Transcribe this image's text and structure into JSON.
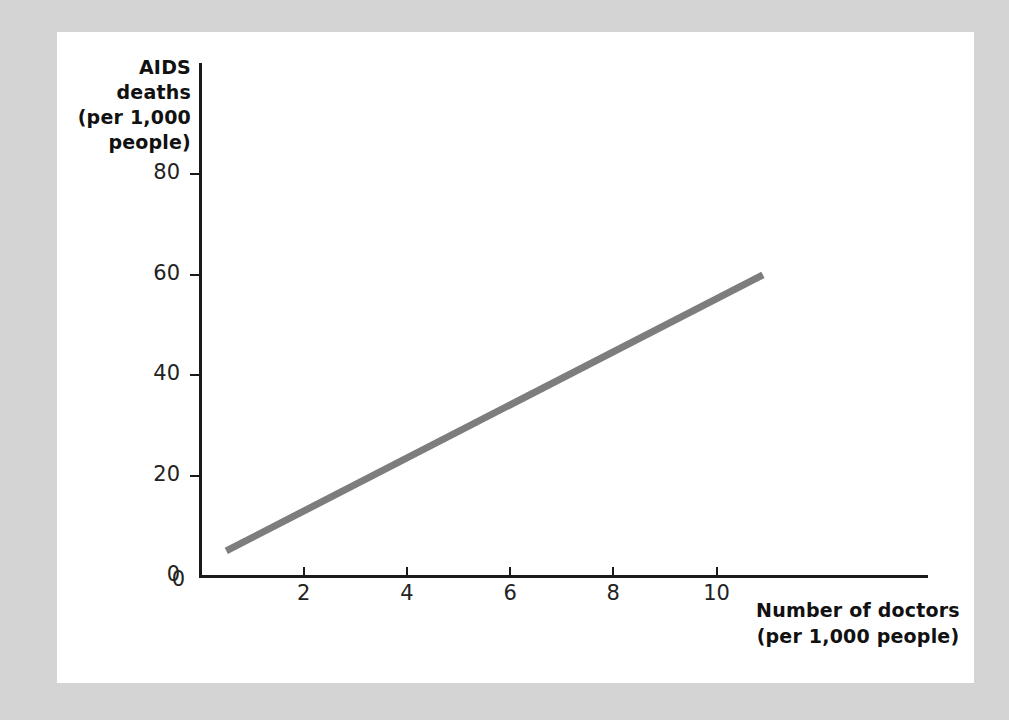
{
  "figure": {
    "background_color": "#d4d4d4",
    "page_color": "#ffffff"
  },
  "chart_data": {
    "type": "line",
    "title": "",
    "xlabel": "Number of doctors (per 1,000 people)",
    "ylabel": "AIDS deaths (per 1,000 people)",
    "xlabel_lines": [
      "Number of doctors",
      "(per 1,000 people)"
    ],
    "ylabel_lines": [
      "AIDS",
      "deaths",
      "(per 1,000",
      "people)"
    ],
    "xlim": [
      0,
      13.6
    ],
    "ylim": [
      0,
      89
    ],
    "xticks": [
      0,
      2,
      4,
      6,
      8,
      10
    ],
    "yticks": [
      0,
      20,
      40,
      60,
      80
    ],
    "xtick_labels": [
      "0",
      "2",
      "4",
      "6",
      "8",
      "10"
    ],
    "ytick_labels": [
      "0",
      "20",
      "40",
      "60",
      "80"
    ],
    "grid": false,
    "legend": false,
    "series": [
      {
        "name": "AIDS deaths vs doctors",
        "color": "#7d7d7d",
        "line_width": 7,
        "x": [
          0.5,
          10.9
        ],
        "y": [
          5,
          60
        ],
        "points": [
          {
            "x": 0.5,
            "y": 5
          },
          {
            "x": 10.9,
            "y": 60
          }
        ]
      }
    ]
  }
}
